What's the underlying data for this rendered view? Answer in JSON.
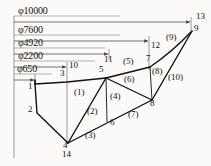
{
  "diagram": {
    "type": "truss-structural-diagram",
    "stroke_color": "#14110f",
    "dimension_color": "#3a3734",
    "background_color": "#fbfaf8",
    "dimensions": [
      {
        "id": "dim-10000",
        "label": "φ10000",
        "value": 10000,
        "unit": "mm",
        "text_x": 18,
        "text_y": 11,
        "line_y": 22,
        "start_x": 14,
        "end_x": 191
      },
      {
        "id": "dim-7600",
        "label": "φ7600",
        "value": 7600,
        "unit": "mm",
        "text_x": 18,
        "text_y": 30,
        "line_y": 41,
        "start_x": 14,
        "end_x": 149
      },
      {
        "id": "dim-4920",
        "label": "φ4920",
        "value": 4920,
        "unit": "mm",
        "text_x": 18,
        "text_y": 44,
        "line_y": 54,
        "start_x": 14,
        "end_x": 109
      },
      {
        "id": "dim-2200",
        "label": "φ2200",
        "value": 2200,
        "unit": "mm",
        "text_x": 18,
        "text_y": 57,
        "line_y": 67,
        "start_x": 14,
        "end_x": 67
      },
      {
        "id": "dim-650",
        "label": "φ650",
        "value": 650,
        "unit": "mm",
        "text_x": 17,
        "text_y": 70,
        "line_y": 80,
        "start_x": 14,
        "end_x": 34
      }
    ],
    "nodes": [
      {
        "id": 1,
        "label": "1",
        "x": 35,
        "y": 84,
        "label_x": 28,
        "label_y": 86
      },
      {
        "id": 2,
        "label": "2",
        "x": 37,
        "y": 113,
        "label_x": 28,
        "label_y": 109
      },
      {
        "id": 3,
        "label": "3",
        "x": 67,
        "y": 82,
        "label_x": 60,
        "label_y": 72
      },
      {
        "id": 4,
        "label": "4",
        "x": 68,
        "y": 143,
        "label_x": 63,
        "label_y": 143
      },
      {
        "id": 5,
        "label": "5",
        "x": 106,
        "y": 78,
        "label_x": 99,
        "label_y": 70
      },
      {
        "id": 6,
        "label": "6",
        "x": 107,
        "y": 122,
        "label_x": 110,
        "label_y": 122
      },
      {
        "id": 7,
        "label": "7",
        "x": 150,
        "y": 67,
        "label_x": 146,
        "label_y": 57
      },
      {
        "id": 8,
        "label": "8",
        "x": 152,
        "y": 100,
        "label_x": 150,
        "label_y": 102
      },
      {
        "id": 9,
        "label": "9",
        "x": 192,
        "y": 31,
        "label_x": 194,
        "label_y": 28
      },
      {
        "id": 10,
        "label": "10",
        "x": 67,
        "y": 67,
        "label_x": 69,
        "label_y": 66
      },
      {
        "id": 11,
        "label": "11",
        "x": 109,
        "y": 54,
        "label_x": 104,
        "label_y": 59
      },
      {
        "id": 12,
        "label": "12",
        "x": 149,
        "y": 41,
        "label_x": 151,
        "label_y": 45
      },
      {
        "id": 13,
        "label": "13",
        "x": 191,
        "y": 22,
        "label_x": 196,
        "label_y": 16
      },
      {
        "id": 14,
        "label": "14",
        "x": 68,
        "y": 160,
        "label_x": 62,
        "label_y": 153
      }
    ],
    "members": [
      {
        "id": "(1)",
        "label": "(1)",
        "from": 1,
        "to": 5,
        "label_x": 74,
        "label_y": 86
      },
      {
        "id": "(2)",
        "label": "(2)",
        "from": 4,
        "to": 5,
        "label_x": 87,
        "label_y": 111
      },
      {
        "id": "(3)",
        "label": "(3)",
        "from": 4,
        "to": 8,
        "label_x": 85,
        "label_y": 134
      },
      {
        "id": "(4)",
        "label": "(4)",
        "from": 5,
        "to": 6,
        "label_x": 110,
        "label_y": 96
      },
      {
        "id": "(5)",
        "label": "(5)",
        "from": 5,
        "to": 7,
        "label_x": 123,
        "label_y": 60
      },
      {
        "id": "(6)",
        "label": "(6)",
        "from": 5,
        "to": 8,
        "label_x": 124,
        "label_y": 79
      },
      {
        "id": "(7)",
        "label": "(7)",
        "from": 6,
        "to": 8,
        "label_x": 128,
        "label_y": 113
      },
      {
        "id": "(8)",
        "label": "(8)",
        "from": 7,
        "to": 8,
        "label_x": 152,
        "label_y": 71
      },
      {
        "id": "(9)",
        "label": "(9)",
        "from": 7,
        "to": 9,
        "label_x": 168,
        "label_y": 38
      },
      {
        "id": "(10)",
        "label": "(10)",
        "from": 8,
        "to": 9,
        "label_x": 170,
        "label_y": 77
      }
    ]
  }
}
